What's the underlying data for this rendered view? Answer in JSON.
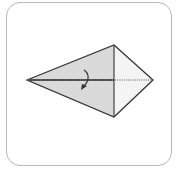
{
  "diagram": {
    "type": "origami-step",
    "colors": {
      "frame_border": "#b8b8b8",
      "shaded_face": "#dadada",
      "light_face": "#f4f4f4",
      "line": "#333333"
    },
    "points": {
      "left_tip": [
        27,
        80
      ],
      "top": [
        114,
        45
      ],
      "bottom": [
        114,
        117
      ],
      "right_tip": [
        153,
        80
      ]
    },
    "instruction_icon": "fold-arrow-down",
    "center_line": "dotted-valley-fold"
  }
}
